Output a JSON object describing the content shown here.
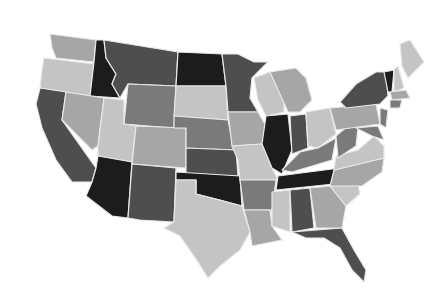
{
  "map": {
    "type": "choropleth",
    "region": "United States (contiguous)",
    "palette": {
      "c1": "#1c1c1c",
      "c2": "#4e4e4e",
      "c3": "#7a7a7a",
      "c4": "#a6a6a6",
      "c5": "#c4c4c4"
    },
    "states": [
      {
        "id": "WA",
        "cls": "c4",
        "d": "M50,34 L96,40 L94,62 L56,58 L52,48 Z"
      },
      {
        "id": "OR",
        "cls": "c5",
        "d": "M44,58 L94,64 L90,96 L40,88 L42,70 Z"
      },
      {
        "id": "CA",
        "cls": "c2",
        "d": "M40,88 L66,92 L62,120 L96,168 L92,182 L72,182 L56,160 L42,128 L36,104 Z"
      },
      {
        "id": "ID",
        "cls": "c1",
        "d": "M96,40 L104,40 L106,58 L116,74 L112,84 L120,98 L90,96 L94,62 Z"
      },
      {
        "id": "NV",
        "cls": "c4",
        "d": "M66,92 L104,98 L98,146 L92,150 L62,120 Z"
      },
      {
        "id": "MT",
        "cls": "c2",
        "d": "M104,40 L178,52 L176,86 L128,84 L120,98 L112,84 L116,74 L106,58 Z"
      },
      {
        "id": "WY",
        "cls": "c3",
        "d": "M128,84 L176,86 L174,128 L124,124 Z"
      },
      {
        "id": "UT",
        "cls": "c5",
        "d": "M104,98 L124,100 L124,124 L136,126 L132,162 L98,156 L98,146 Z"
      },
      {
        "id": "AZ",
        "cls": "c1",
        "d": "M98,156 L132,162 L128,218 L112,216 L86,196 L92,182 L96,168 Z"
      },
      {
        "id": "CO",
        "cls": "c4",
        "d": "M136,126 L186,128 L186,168 L132,164 Z"
      },
      {
        "id": "NM",
        "cls": "c2",
        "d": "M132,164 L176,168 L174,222 L140,220 L128,218 Z"
      },
      {
        "id": "ND",
        "cls": "c1",
        "d": "M178,52 L222,54 L226,86 L176,86 Z"
      },
      {
        "id": "SD",
        "cls": "c5",
        "d": "M176,86 L226,86 L228,120 L174,116 Z"
      },
      {
        "id": "NE",
        "cls": "c3",
        "d": "M174,116 L228,120 L234,150 L186,148 L186,128 L174,128 Z"
      },
      {
        "id": "KS",
        "cls": "c2",
        "d": "M186,148 L236,150 L238,176 L186,174 Z"
      },
      {
        "id": "OK",
        "cls": "c1",
        "d": "M176,172 L240,176 L242,206 L220,200 L196,194 L196,180 L176,180 Z"
      },
      {
        "id": "TX",
        "cls": "c5",
        "d": "M176,180 L196,180 L196,194 L242,206 L250,232 L240,250 L220,266 L208,278 L198,262 L180,236 L164,228 L174,222 Z"
      },
      {
        "id": "MN",
        "cls": "c2",
        "d": "M222,54 L238,54 L254,62 L268,62 L252,78 L250,98 L258,112 L228,112 L226,86 Z"
      },
      {
        "id": "IA",
        "cls": "c4",
        "d": "M228,112 L258,112 L266,126 L262,144 L232,146 Z"
      },
      {
        "id": "MO",
        "cls": "c5",
        "d": "M232,146 L262,144 L272,168 L278,180 L240,180 L238,160 Z"
      },
      {
        "id": "AR",
        "cls": "c3",
        "d": "M240,180 L276,180 L272,210 L244,210 Z"
      },
      {
        "id": "LA",
        "cls": "c4",
        "d": "M244,210 L270,210 L272,226 L282,240 L252,246 L250,232 Z"
      },
      {
        "id": "WI",
        "cls": "c5",
        "d": "M254,78 L270,72 L284,84 L284,112 L266,116 L258,100 Z"
      },
      {
        "id": "IL",
        "cls": "c1",
        "d": "M266,116 L288,114 L292,150 L282,174 L272,168 L262,144 Z"
      },
      {
        "id": "MI",
        "cls": "c4",
        "d": "M270,72 L296,68 L306,78 L312,100 L300,112 L288,112 Z"
      },
      {
        "id": "IN",
        "cls": "c2",
        "d": "M290,116 L306,114 L308,148 L292,154 Z"
      },
      {
        "id": "OH",
        "cls": "c5",
        "d": "M306,112 L330,108 L336,134 L318,148 L308,146 Z"
      },
      {
        "id": "KY",
        "cls": "c3",
        "d": "M282,170 L300,152 L318,148 L336,138 L332,160 L292,172 Z"
      },
      {
        "id": "TN",
        "cls": "c1",
        "d": "M278,176 L340,168 L334,184 L276,190 Z"
      },
      {
        "id": "MS",
        "cls": "c5",
        "d": "M272,192 L290,190 L290,232 L272,226 Z"
      },
      {
        "id": "AL",
        "cls": "c2",
        "d": "M290,190 L310,188 L314,228 L292,232 Z"
      },
      {
        "id": "GA",
        "cls": "c4",
        "d": "M310,188 L330,186 L346,206 L342,228 L316,228 Z"
      },
      {
        "id": "FL",
        "cls": "c2",
        "d": "M292,232 L342,228 L354,250 L366,270 L364,282 L352,270 L340,248 L324,238 L306,238 Z"
      },
      {
        "id": "SC",
        "cls": "c5",
        "d": "M330,186 L358,184 L360,194 L346,206 Z"
      },
      {
        "id": "NC",
        "cls": "c4",
        "d": "M334,170 L384,158 L382,172 L362,186 L330,186 Z"
      },
      {
        "id": "VA",
        "cls": "c5",
        "d": "M336,156 L358,150 L374,136 L384,146 L384,158 L334,170 Z"
      },
      {
        "id": "WV",
        "cls": "c3",
        "d": "M336,136 L350,124 L358,128 L356,146 L338,158 Z"
      },
      {
        "id": "PA",
        "cls": "c4",
        "d": "M330,108 L376,104 L380,124 L336,130 Z"
      },
      {
        "id": "NY",
        "cls": "c2",
        "d": "M340,102 L356,84 L376,72 L386,72 L388,96 L380,104 L346,108 Z"
      },
      {
        "id": "VT",
        "cls": "c1",
        "d": "M384,72 L394,70 L392,92 L388,92 Z"
      },
      {
        "id": "NH",
        "cls": "c5",
        "d": "M394,70 L398,66 L404,88 L394,92 Z"
      },
      {
        "id": "ME",
        "cls": "c5",
        "d": "M400,44 L410,40 L424,62 L408,78 L402,66 Z"
      },
      {
        "id": "MA",
        "cls": "c4",
        "d": "M390,92 L406,90 L410,98 L392,100 Z"
      },
      {
        "id": "CT",
        "cls": "c3",
        "d": "M390,100 L402,100 L400,108 L390,108 Z"
      },
      {
        "id": "NJ",
        "cls": "c3",
        "d": "M380,108 L388,110 L386,128 L380,124 Z"
      },
      {
        "id": "MD",
        "cls": "c3",
        "d": "M356,128 L378,126 L384,140 L372,136 Z"
      }
    ]
  }
}
